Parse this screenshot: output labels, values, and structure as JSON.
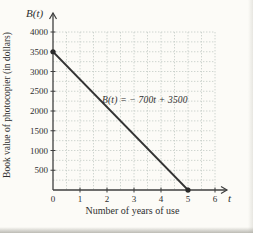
{
  "figure": {
    "y_axis_symbol": "B(t)",
    "x_axis_symbol": "t",
    "y_axis_caption": "Book value of photocopier (in dollars)",
    "x_axis_caption": "Number of years of use"
  },
  "chart_data": {
    "type": "line",
    "title": "",
    "xlabel": "Number of years of use",
    "ylabel": "Book value of photocopier (in dollars)",
    "x_var": "t",
    "y_var": "B(t)",
    "series": [
      {
        "name": "B(t)",
        "points": [
          [
            0,
            3500
          ],
          [
            5,
            0
          ]
        ]
      }
    ],
    "annotation": "B(t) = − 700t + 3500",
    "endpoint_markers": [
      [
        0,
        3500
      ],
      [
        5,
        0
      ]
    ],
    "x_ticks": [
      0,
      1,
      2,
      3,
      4,
      5,
      6
    ],
    "y_ticks": [
      500,
      1000,
      1500,
      2000,
      2500,
      3000,
      3500,
      4000
    ],
    "xlim": [
      0,
      6
    ],
    "ylim": [
      0,
      4000
    ],
    "x_grid_step": 0.5,
    "y_grid_step": 250,
    "grid": true,
    "legend_position": "none",
    "colors": {
      "line": "#333333",
      "marker": "#2a2a2a",
      "grid": "#c3cbc5",
      "axis": "#3f3f3f",
      "text": "#2f2f2f",
      "background": "#fcfbf7"
    }
  }
}
